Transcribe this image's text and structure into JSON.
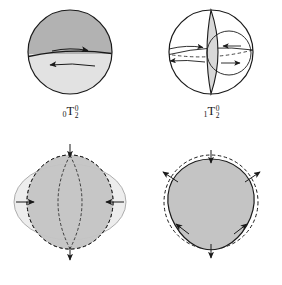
{
  "figure": {
    "background_color": "#ffffff",
    "stroke_color": "#1a1a1a"
  },
  "palette": {
    "dark_gray_fill": "#b2b2b2",
    "mid_gray_fill": "#c4c4c4",
    "light_gray_fill": "#e2e2e2",
    "pale_gray_fill": "#ededed",
    "outline": "#1a1a1a"
  },
  "panels": [
    {
      "id": "0T2",
      "position": "top-left",
      "label": {
        "pre_subscript": "0",
        "letter": "T",
        "superscript": "0",
        "subscript": "2"
      },
      "shape": "sphere divided at the equator",
      "upper_fill": "#b2b2b2",
      "lower_fill": "#e2e2e2",
      "arrows": [
        {
          "name": "upper-hemisphere-arrow",
          "direction": "right"
        },
        {
          "name": "lower-hemisphere-arrow",
          "direction": "left"
        }
      ]
    },
    {
      "id": "1T2",
      "position": "top-right",
      "label": {
        "pre_subscript": "1",
        "letter": "T",
        "superscript": "0",
        "subscript": "2"
      },
      "shape": "unfilled sphere with a vertical lens-shaped nodal surface and an inner circle",
      "lens_fill": "#d8d8d8",
      "arrows": [
        {
          "name": "outer-upper-arrow",
          "direction": "right"
        },
        {
          "name": "outer-lower-arrow",
          "direction": "left"
        },
        {
          "name": "inner-upper-arrow",
          "direction": "left"
        },
        {
          "name": "inner-lower-arrow",
          "direction": "right"
        }
      ]
    },
    {
      "id": "0S2",
      "position": "bottom-left",
      "label": {
        "pre_subscript": "0",
        "letter": "S",
        "superscript": "0",
        "subscript": "2"
      },
      "shape": "football mode: prolate ellipse over a dashed oblate reference outline",
      "front_fill": "#c4c4c4",
      "back_fill": "#ededed",
      "arrows": [
        {
          "name": "left-inward-arrow",
          "direction": "right"
        },
        {
          "name": "right-inward-arrow",
          "direction": "left"
        },
        {
          "name": "top-pole-arrow",
          "direction": "down"
        },
        {
          "name": "bottom-pole-arrow",
          "direction": "down"
        }
      ]
    },
    {
      "id": "0S3",
      "position": "bottom-right",
      "label": {
        "pre_subscript": "0",
        "letter": "S",
        "superscript": "0",
        "subscript": "3"
      },
      "shape": "pear-like deformed sphere over a dashed circular reference outline",
      "front_fill": "#c4c4c4",
      "arrows": [
        {
          "name": "top-inward-arrow",
          "direction": "down"
        },
        {
          "name": "upper-left-outward-arrow",
          "direction": "up-left"
        },
        {
          "name": "upper-right-outward-arrow",
          "direction": "up-right"
        },
        {
          "name": "lower-left-inward-arrow",
          "direction": "up-left"
        },
        {
          "name": "lower-right-inward-arrow",
          "direction": "up-right"
        },
        {
          "name": "bottom-pole-arrow",
          "direction": "down"
        }
      ]
    }
  ]
}
